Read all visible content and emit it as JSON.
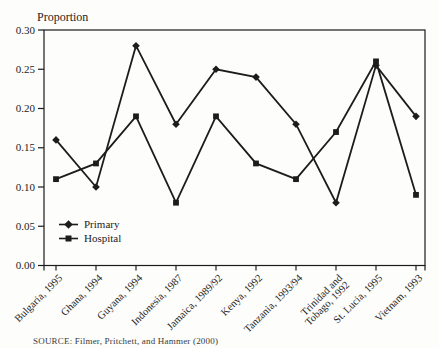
{
  "figure": {
    "source": "SOURCE: Filmer, Pritchett, and Hammer (2000)"
  },
  "chart_data": {
    "type": "line",
    "title": "Proportion",
    "categories": [
      "Bulgaria, 1995",
      "Ghana, 1994",
      "Guyana, 1994",
      "Indonesia, 1987",
      "Jamaica, 1989/92",
      "Kenya, 1992",
      "Tanzania, 1993/94",
      "Trinidad and\nTobago, 1992",
      "St. Lucia, 1995",
      "Vietnam, 1993"
    ],
    "series": [
      {
        "name": "Primary",
        "marker": "diamond",
        "values": [
          0.16,
          0.1,
          0.28,
          0.18,
          0.25,
          0.24,
          0.18,
          0.08,
          0.255,
          0.19
        ]
      },
      {
        "name": "Hospital",
        "marker": "square",
        "values": [
          0.11,
          0.13,
          0.19,
          0.08,
          0.19,
          0.13,
          0.11,
          0.17,
          0.26,
          0.09
        ]
      }
    ],
    "xlabel": "",
    "ylabel": "Proportion",
    "ylim": [
      0,
      0.3
    ],
    "ytick_step": 0.05,
    "ytick_labels": [
      "0.00",
      "0.05",
      "0.10",
      "0.15",
      "0.20",
      "0.25",
      "0.30"
    ],
    "grid": false,
    "legend_position": "inside-lower-left",
    "line_color": "#1c1c1c",
    "background_color": "#fdfdfb"
  }
}
